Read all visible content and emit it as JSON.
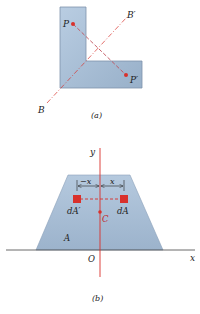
{
  "figure_a": {
    "caption": "(a)",
    "point_P": "P",
    "point_P_prime": "P′",
    "axis_B": "B",
    "axis_B_prime": "B′"
  },
  "figure_b": {
    "caption": "(b)",
    "axis_x": "x",
    "axis_y": "y",
    "origin": "O",
    "area_label": "A",
    "centroid": "C",
    "element_left": "dA′",
    "element_right": "dA",
    "dim_left": "−x",
    "dim_right": "x"
  },
  "colors": {
    "shape_fill": "#a9bfd6",
    "shape_stroke": "#7d93ab",
    "accent_red": "#d9302b",
    "axis_line": "#444444"
  }
}
